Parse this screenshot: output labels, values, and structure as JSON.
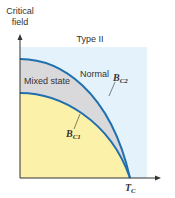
{
  "diagram": {
    "y_axis_label_line1": "Critical",
    "y_axis_label_line2": "field",
    "title": "Type II",
    "region_normal": "Normal",
    "region_mixed": "Mixed state",
    "curve_upper": {
      "symbol": "B",
      "subscript": "C2"
    },
    "curve_lower": {
      "symbol": "B",
      "subscript": "C1"
    },
    "x_axis_marker": {
      "symbol": "T",
      "subscript": "C"
    }
  },
  "colors": {
    "normal_region": "#e4f2fb",
    "mixed_region": "#d9d9dc",
    "superconducting_region": "#fbf1a9",
    "curve": "#1f6fae",
    "axis": "#333333"
  }
}
